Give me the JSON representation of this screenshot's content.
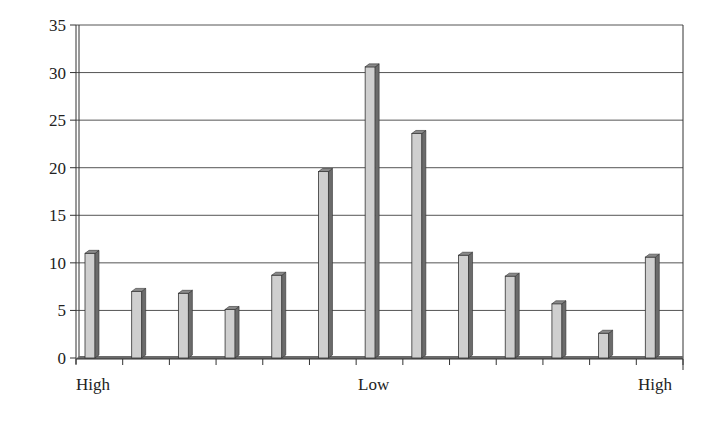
{
  "chart_data": {
    "type": "bar",
    "title": "",
    "xlabel": "",
    "ylabel": "",
    "ylim": [
      0,
      35
    ],
    "yticks": [
      0,
      5,
      10,
      15,
      20,
      25,
      30,
      35
    ],
    "grid": true,
    "legend": "none",
    "style": "3d-column",
    "x_annotations": [
      {
        "label": "High",
        "position": "left"
      },
      {
        "label": "Low",
        "position": "center"
      },
      {
        "label": "High",
        "position": "right"
      }
    ],
    "categories": [
      "1",
      "2",
      "3",
      "4",
      "5",
      "6",
      "7",
      "8",
      "9",
      "10",
      "11",
      "12",
      "13"
    ],
    "values": [
      11.0,
      7.0,
      6.8,
      5.1,
      8.7,
      19.6,
      30.6,
      23.6,
      10.8,
      8.6,
      5.7,
      2.6,
      10.6
    ]
  },
  "axis": {
    "y_labels": [
      "0",
      "5",
      "10",
      "15",
      "20",
      "25",
      "30",
      "35"
    ],
    "x_left_label": "High",
    "x_center_label": "Low",
    "x_right_label": "High"
  },
  "colors": {
    "bar_front": "#cfcfcf",
    "bar_side": "#6b6b6b",
    "bar_top": "#8a8a8a",
    "grid": "#555555",
    "axis": "#333333"
  }
}
